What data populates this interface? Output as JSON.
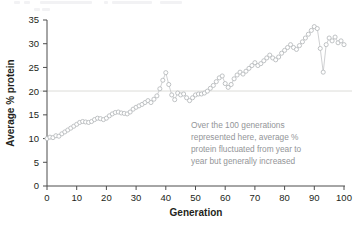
{
  "chart_data": {
    "type": "scatter",
    "title": "",
    "xlabel": "Generation",
    "ylabel": "Average % protein",
    "xlim": [
      0,
      100
    ],
    "ylim": [
      0,
      35
    ],
    "xticks": [
      0,
      10,
      20,
      30,
      40,
      50,
      60,
      70,
      80,
      90,
      100
    ],
    "yticks": [
      0,
      5,
      10,
      15,
      20,
      25,
      30,
      35
    ],
    "grid": false,
    "legend": null,
    "marker_style": "open-circle",
    "connect_points": true,
    "reference_lines": [
      {
        "axis": "y",
        "value": 20,
        "color": "#dcdcd8"
      }
    ],
    "annotations": [
      {
        "text": "Over the 100 generations represented here, average % protein fluctuated from year to year but generally increased",
        "lines": [
          "Over the 100 generations",
          "represented here, average %",
          "protein fluctuated from year to",
          "year but generally increased"
        ],
        "color": "#939598",
        "x": 57,
        "y": 12
      }
    ],
    "series": [
      {
        "name": "Average % protein",
        "color": "#b5b8bb",
        "x": [
          0,
          1,
          2,
          3,
          4,
          5,
          6,
          7,
          8,
          9,
          10,
          11,
          12,
          13,
          14,
          15,
          16,
          17,
          18,
          19,
          20,
          21,
          22,
          23,
          24,
          25,
          26,
          27,
          28,
          29,
          30,
          31,
          32,
          33,
          34,
          35,
          36,
          37,
          38,
          39,
          40,
          41,
          42,
          43,
          44,
          45,
          46,
          47,
          48,
          49,
          50,
          51,
          52,
          53,
          54,
          55,
          56,
          57,
          58,
          59,
          60,
          61,
          62,
          63,
          64,
          65,
          66,
          67,
          68,
          69,
          70,
          71,
          72,
          73,
          74,
          75,
          76,
          77,
          78,
          79,
          80,
          81,
          82,
          83,
          84,
          85,
          86,
          87,
          88,
          89,
          90,
          91,
          92,
          93,
          94,
          95,
          96,
          97,
          98,
          99,
          100
        ],
        "values": [
          10.0,
          10.3,
          10.2,
          10.6,
          10.5,
          11.0,
          11.4,
          11.8,
          12.2,
          12.6,
          13.0,
          13.4,
          13.6,
          13.5,
          13.4,
          13.6,
          14.0,
          14.3,
          14.2,
          14.0,
          14.3,
          14.8,
          15.2,
          15.5,
          15.6,
          15.4,
          15.3,
          15.2,
          15.6,
          16.2,
          16.6,
          16.9,
          17.2,
          17.6,
          18.0,
          17.6,
          18.3,
          19.0,
          20.5,
          22.3,
          23.9,
          21.4,
          19.2,
          18.2,
          19.6,
          19.2,
          19.4,
          18.6,
          18.0,
          18.6,
          19.2,
          19.4,
          19.4,
          19.6,
          20.0,
          20.6,
          21.2,
          22.0,
          22.8,
          23.2,
          21.6,
          20.8,
          21.4,
          22.6,
          23.4,
          24.0,
          23.6,
          24.2,
          24.8,
          25.4,
          26.0,
          25.4,
          25.8,
          26.4,
          27.0,
          27.6,
          27.0,
          26.6,
          27.2,
          28.0,
          28.6,
          29.2,
          29.8,
          29.2,
          28.8,
          29.6,
          30.4,
          31.2,
          32.0,
          32.8,
          33.6,
          33.2,
          29.0,
          24.0,
          29.8,
          31.2,
          30.6,
          31.4,
          30.2,
          30.6,
          29.8
        ]
      }
    ]
  },
  "axis": {
    "y_title": "Average % protein",
    "x_title": "Generation"
  }
}
